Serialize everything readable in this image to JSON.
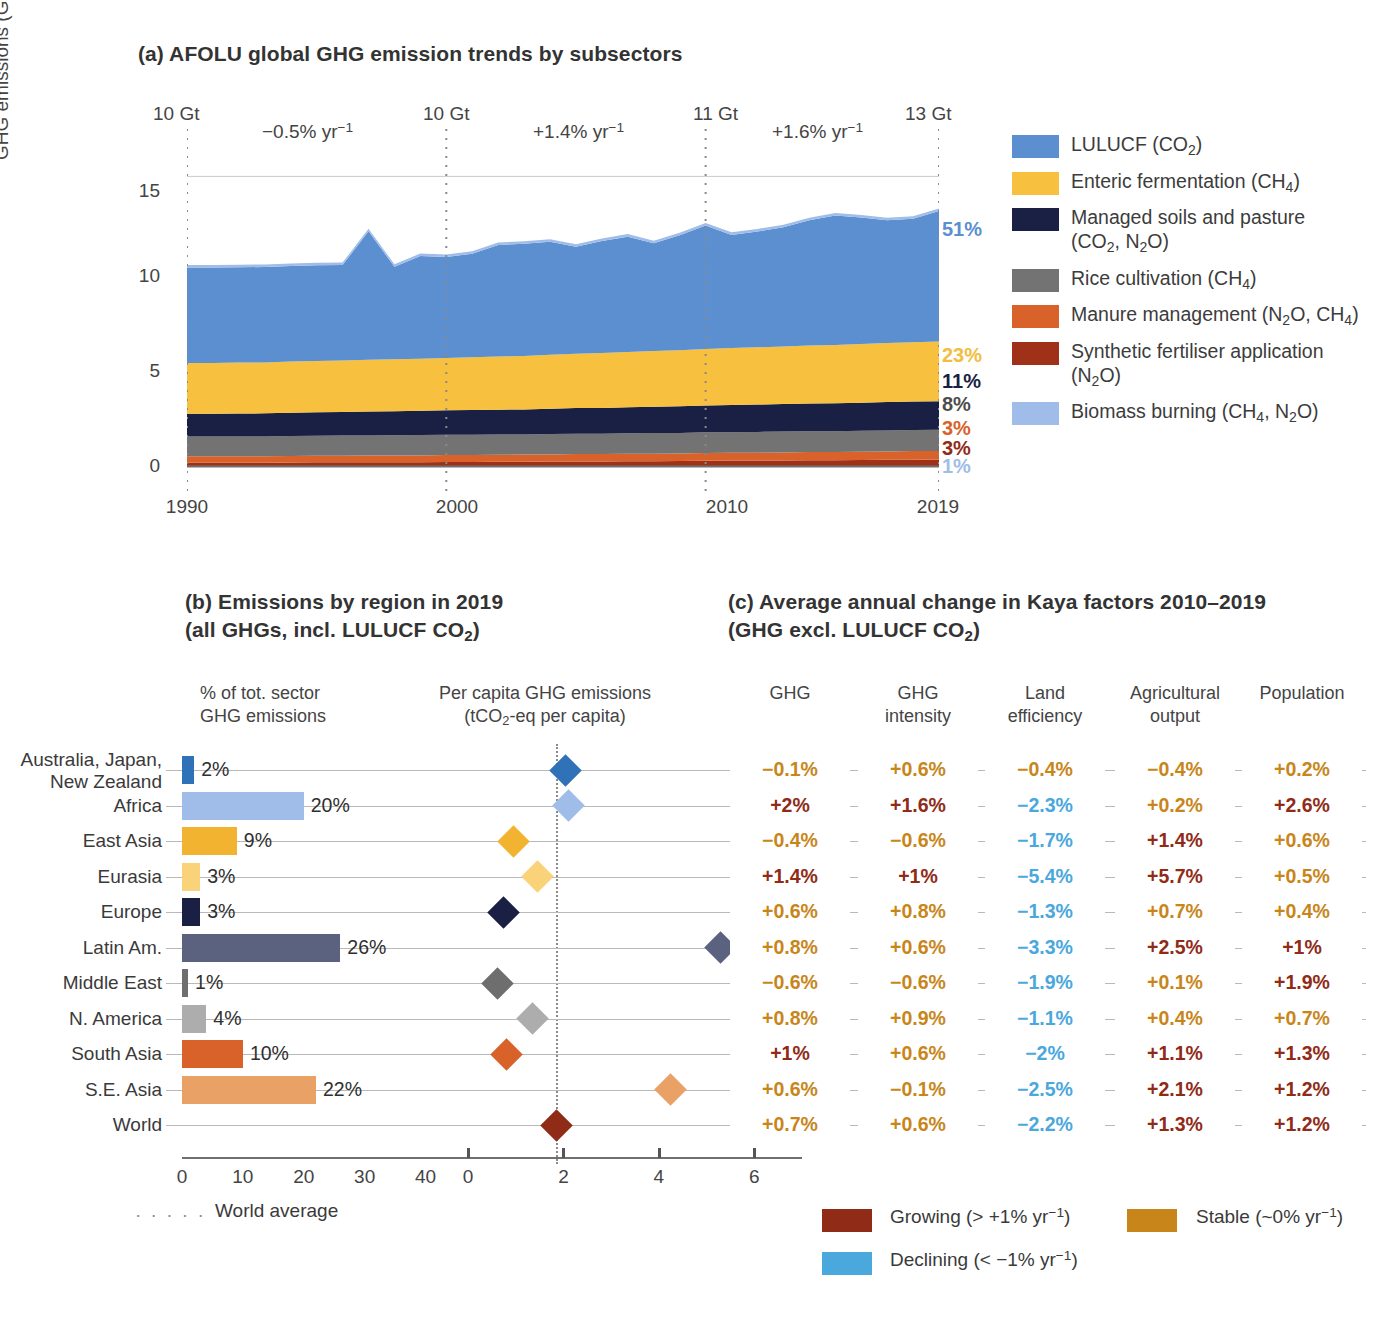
{
  "panel_a": {
    "title": "(a) AFOLU global GHG emission trends by subsectors",
    "y_axis_label": "GHG emissions (GtCO2-eq yr-1)",
    "y_ticks": [
      "15",
      "10",
      "5",
      "0"
    ],
    "x_ticks": [
      "1990",
      "2000",
      "2010",
      "2019"
    ],
    "gt_markers": [
      {
        "label": "10 Gt",
        "year": 1990
      },
      {
        "label": "10 Gt",
        "year": 2000
      },
      {
        "label": "11 Gt",
        "year": 2010
      },
      {
        "label": "13 Gt",
        "year": 2019
      }
    ],
    "rate_labels": [
      {
        "label": "−0.5% yr-1",
        "between": "1990-2000"
      },
      {
        "label": "+1.4% yr-1",
        "between": "2000-2010"
      },
      {
        "label": "+1.6% yr-1",
        "between": "2010-2019"
      }
    ],
    "share_labels": [
      {
        "value": "51%",
        "series": "LULUCF (CO2)",
        "color": "#5b8fd0"
      },
      {
        "value": "23%",
        "series": "Enteric fermentation (CH4)",
        "color": "#f2bd42"
      },
      {
        "value": "11%",
        "series": "Managed soils and pasture (CO2, N2O)",
        "color": "#1a1f44"
      },
      {
        "value": "8%",
        "series": "Rice cultivation (CH4)",
        "color": "#4d4d4d"
      },
      {
        "value": "3%",
        "series": "Manure management (N2O, CH4)",
        "color": "#d9622b"
      },
      {
        "value": "3%",
        "series": "Synthetic fertiliser application (N2O)",
        "color": "#8f2b17"
      },
      {
        "value": "1%",
        "series": "Biomass burning (CH4, N2O)",
        "color": "#9fbde8"
      }
    ],
    "legend": [
      {
        "label_html": "LULUCF (CO<sub>2</sub>)",
        "color": "#5b8fd0"
      },
      {
        "label_html": "Enteric fermentation (CH<sub>4</sub>)",
        "color": "#f7c03f"
      },
      {
        "label_html": "Managed soils and pasture<br>(CO<sub>2</sub>, N<sub>2</sub>O)",
        "color": "#1a1f44"
      },
      {
        "label_html": "Rice cultivation (CH<sub>4</sub>)",
        "color": "#737373"
      },
      {
        "label_html": "Manure management (N<sub>2</sub>O, CH<sub>4</sub>)",
        "color": "#d9622b"
      },
      {
        "label_html": "Synthetic fertiliser application<br>(N<sub>2</sub>O)",
        "color": "#9e3118"
      },
      {
        "label_html": "Biomass burning (CH<sub>4</sub>, N<sub>2</sub>O)",
        "color": "#9fbde8"
      }
    ]
  },
  "panel_b": {
    "title_line1": "(b) Emissions by region in 2019",
    "title_line2": "(all GHGs, incl. LULUCF CO2)",
    "col1_head_line1": "% of tot. sector",
    "col1_head_line2": "GHG emissions",
    "col2_head_line1": "Per capita GHG emissions",
    "col2_head_line2": "(tCO2-eq per capita)",
    "x_ticks_left": [
      "0",
      "10",
      "20",
      "30",
      "40"
    ],
    "x_ticks_right": [
      "0",
      "2",
      "4",
      "6"
    ],
    "world_average_label": "World average"
  },
  "panel_c": {
    "title_line1": "(c) Average annual change in Kaya factors 2010–2019",
    "title_line2": "(GHG excl. LULUCF CO2)",
    "columns": [
      "GHG",
      "GHG intensity",
      "Land efficiency",
      "Agricultural output",
      "Population"
    ],
    "columns_split": [
      {
        "l1": "GHG",
        "l2": ""
      },
      {
        "l1": "GHG",
        "l2": "intensity"
      },
      {
        "l1": "Land",
        "l2": "efficiency"
      },
      {
        "l1": "Agricultural",
        "l2": "output"
      },
      {
        "l1": "Population",
        "l2": ""
      }
    ],
    "category_legend": [
      {
        "label": "Growing (> +1% yr-1)",
        "color": "#8f2b17"
      },
      {
        "label": "Stable (~0% yr-1)",
        "color": "#c8861a"
      },
      {
        "label": "Declining (< −1% yr-1)",
        "color": "#4aa8dd"
      }
    ]
  },
  "colors": {
    "growing": "#8f2b17",
    "stable": "#c8861a",
    "declining": "#4aa8dd",
    "gridline": "#b9b9b9",
    "axis": "#707070"
  },
  "chart_data": {
    "type": "area",
    "title": "(a) AFOLU global GHG emission trends by subsectors",
    "xlabel": "",
    "ylabel": "GHG emissions (GtCO2-eq yr-1)",
    "xlim": [
      1990,
      2019
    ],
    "ylim": [
      0,
      16
    ],
    "yticks": [
      0,
      5,
      10,
      15
    ],
    "grid": true,
    "legend_position": "right",
    "x": [
      1990,
      1991,
      1992,
      1993,
      1994,
      1995,
      1996,
      1997,
      1998,
      1999,
      2000,
      2001,
      2002,
      2003,
      2004,
      2005,
      2006,
      2007,
      2008,
      2009,
      2010,
      2011,
      2012,
      2013,
      2014,
      2015,
      2016,
      2017,
      2018,
      2019
    ],
    "series": [
      {
        "name": "Synthetic fertiliser application (N2O)",
        "color": "#9e3118",
        "values": [
          0.22,
          0.22,
          0.22,
          0.22,
          0.23,
          0.24,
          0.24,
          0.24,
          0.25,
          0.25,
          0.26,
          0.26,
          0.27,
          0.27,
          0.28,
          0.29,
          0.29,
          0.3,
          0.3,
          0.31,
          0.32,
          0.33,
          0.33,
          0.34,
          0.35,
          0.35,
          0.36,
          0.37,
          0.38,
          0.39
        ]
      },
      {
        "name": "Manure management (N2O, CH4)",
        "color": "#d9622b",
        "values": [
          0.33,
          0.33,
          0.33,
          0.33,
          0.34,
          0.34,
          0.34,
          0.35,
          0.35,
          0.35,
          0.36,
          0.36,
          0.36,
          0.37,
          0.37,
          0.38,
          0.38,
          0.38,
          0.39,
          0.39,
          0.4,
          0.4,
          0.41,
          0.41,
          0.42,
          0.42,
          0.43,
          0.43,
          0.44,
          0.44
        ]
      },
      {
        "name": "Rice cultivation (CH4)",
        "color": "#737373",
        "values": [
          1.02,
          1.02,
          1.02,
          1.03,
          1.03,
          1.03,
          1.04,
          1.04,
          1.04,
          1.05,
          1.05,
          1.05,
          1.05,
          1.04,
          1.05,
          1.05,
          1.05,
          1.06,
          1.06,
          1.06,
          1.07,
          1.07,
          1.07,
          1.08,
          1.08,
          1.08,
          1.08,
          1.09,
          1.09,
          1.09
        ]
      },
      {
        "name": "Managed soils and pasture (CO2, N2O)",
        "color": "#1a1f44",
        "values": [
          1.18,
          1.18,
          1.19,
          1.19,
          1.2,
          1.21,
          1.22,
          1.23,
          1.24,
          1.25,
          1.26,
          1.27,
          1.28,
          1.29,
          1.31,
          1.32,
          1.33,
          1.34,
          1.36,
          1.37,
          1.38,
          1.4,
          1.41,
          1.42,
          1.43,
          1.44,
          1.45,
          1.46,
          1.47,
          1.48
        ]
      },
      {
        "name": "Enteric fermentation (CH4)",
        "color": "#f7c03f",
        "values": [
          2.62,
          2.62,
          2.63,
          2.63,
          2.64,
          2.65,
          2.66,
          2.67,
          2.68,
          2.69,
          2.7,
          2.72,
          2.74,
          2.76,
          2.78,
          2.81,
          2.83,
          2.85,
          2.88,
          2.9,
          2.92,
          2.94,
          2.96,
          2.97,
          2.99,
          3.01,
          3.03,
          3.05,
          3.06,
          3.08
        ]
      },
      {
        "name": "LULUCF (CO2)",
        "color": "#5b8fd0",
        "values": [
          4.93,
          4.93,
          4.92,
          4.92,
          4.93,
          4.94,
          4.92,
          6.64,
          4.77,
          5.3,
          5.21,
          5.35,
          5.76,
          5.79,
          5.83,
          5.52,
          5.78,
          5.96,
          5.56,
          5.93,
          6.37,
          5.84,
          5.98,
          6.15,
          6.47,
          6.68,
          6.53,
          6.34,
          6.37,
          6.73
        ]
      },
      {
        "name": "Biomass burning (CH4, N2O)",
        "color": "#9fbde8",
        "values": [
          0.13,
          0.13,
          0.13,
          0.13,
          0.13,
          0.13,
          0.13,
          0.13,
          0.13,
          0.13,
          0.13,
          0.13,
          0.13,
          0.13,
          0.13,
          0.13,
          0.13,
          0.13,
          0.13,
          0.13,
          0.13,
          0.13,
          0.13,
          0.13,
          0.13,
          0.13,
          0.13,
          0.13,
          0.13,
          0.13
        ]
      }
    ],
    "totals_annotated": [
      {
        "year": 1990,
        "label": "10 Gt"
      },
      {
        "year": 2000,
        "label": "10 Gt"
      },
      {
        "year": 2010,
        "label": "11 Gt"
      },
      {
        "year": 2019,
        "label": "13 Gt"
      }
    ],
    "growth_rates": [
      "−0.5% yr-1",
      "+1.4% yr-1",
      "+1.6% yr-1"
    ]
  },
  "region_table": {
    "x_scale_left_max": 45,
    "x_scale_right_max": 7,
    "world_average_value": 1.85,
    "rows": [
      {
        "region": "Australia, Japan,\nNew Zealand",
        "share_pct": "2%",
        "share_value": 2,
        "per_capita": 2.05,
        "color": "#2f72b8",
        "kaya": [
          {
            "v": "−0.1%",
            "cat": "stable"
          },
          {
            "v": "+0.6%",
            "cat": "stable"
          },
          {
            "v": "−0.4%",
            "cat": "stable"
          },
          {
            "v": "−0.4%",
            "cat": "stable"
          },
          {
            "v": "+0.2%",
            "cat": "stable"
          }
        ]
      },
      {
        "region": "Africa",
        "share_pct": "20%",
        "share_value": 20,
        "per_capita": 2.1,
        "color": "#9fbde8",
        "kaya": [
          {
            "v": "+2%",
            "cat": "growing"
          },
          {
            "v": "+1.6%",
            "cat": "growing"
          },
          {
            "v": "−2.3%",
            "cat": "declining"
          },
          {
            "v": "+0.2%",
            "cat": "stable"
          },
          {
            "v": "+2.6%",
            "cat": "growing"
          }
        ]
      },
      {
        "region": "East Asia",
        "share_pct": "9%",
        "share_value": 9,
        "per_capita": 0.95,
        "color": "#f2b430",
        "kaya": [
          {
            "v": "−0.4%",
            "cat": "stable"
          },
          {
            "v": "−0.6%",
            "cat": "stable"
          },
          {
            "v": "−1.7%",
            "cat": "declining"
          },
          {
            "v": "+1.4%",
            "cat": "growing"
          },
          {
            "v": "+0.6%",
            "cat": "stable"
          }
        ]
      },
      {
        "region": "Eurasia",
        "share_pct": "3%",
        "share_value": 3,
        "per_capita": 1.45,
        "color": "#fad27a",
        "kaya": [
          {
            "v": "+1.4%",
            "cat": "growing"
          },
          {
            "v": "+1%",
            "cat": "growing"
          },
          {
            "v": "−5.4%",
            "cat": "declining"
          },
          {
            "v": "+5.7%",
            "cat": "growing"
          },
          {
            "v": "+0.5%",
            "cat": "stable"
          }
        ]
      },
      {
        "region": "Europe",
        "share_pct": "3%",
        "share_value": 3,
        "per_capita": 0.75,
        "color": "#1a1f44",
        "kaya": [
          {
            "v": "+0.6%",
            "cat": "stable"
          },
          {
            "v": "+0.8%",
            "cat": "stable"
          },
          {
            "v": "−1.3%",
            "cat": "declining"
          },
          {
            "v": "+0.7%",
            "cat": "stable"
          },
          {
            "v": "+0.4%",
            "cat": "stable"
          }
        ]
      },
      {
        "region": "Latin Am.",
        "share_pct": "26%",
        "share_value": 26,
        "per_capita": 5.3,
        "color": "#5a6280",
        "kaya": [
          {
            "v": "+0.8%",
            "cat": "stable"
          },
          {
            "v": "+0.6%",
            "cat": "stable"
          },
          {
            "v": "−3.3%",
            "cat": "declining"
          },
          {
            "v": "+2.5%",
            "cat": "growing"
          },
          {
            "v": "+1%",
            "cat": "growing"
          }
        ]
      },
      {
        "region": "Middle East",
        "share_pct": "1%",
        "share_value": 1,
        "per_capita": 0.62,
        "color": "#6e6e6e",
        "kaya": [
          {
            "v": "−0.6%",
            "cat": "stable"
          },
          {
            "v": "−0.6%",
            "cat": "stable"
          },
          {
            "v": "−1.9%",
            "cat": "declining"
          },
          {
            "v": "+0.1%",
            "cat": "stable"
          },
          {
            "v": "+1.9%",
            "cat": "growing"
          }
        ]
      },
      {
        "region": "N. America",
        "share_pct": "4%",
        "share_value": 4,
        "per_capita": 1.35,
        "color": "#adadad",
        "kaya": [
          {
            "v": "+0.8%",
            "cat": "stable"
          },
          {
            "v": "+0.9%",
            "cat": "stable"
          },
          {
            "v": "−1.1%",
            "cat": "declining"
          },
          {
            "v": "+0.4%",
            "cat": "stable"
          },
          {
            "v": "+0.7%",
            "cat": "stable"
          }
        ]
      },
      {
        "region": "South Asia",
        "share_pct": "10%",
        "share_value": 10,
        "per_capita": 0.8,
        "color": "#d9622b",
        "kaya": [
          {
            "v": "+1%",
            "cat": "growing"
          },
          {
            "v": "+0.6%",
            "cat": "stable"
          },
          {
            "v": "−2%",
            "cat": "declining"
          },
          {
            "v": "+1.1%",
            "cat": "growing"
          },
          {
            "v": "+1.3%",
            "cat": "growing"
          }
        ]
      },
      {
        "region": "S.E. Asia",
        "share_pct": "22%",
        "share_value": 22,
        "per_capita": 4.25,
        "color": "#e9a165",
        "kaya": [
          {
            "v": "+0.6%",
            "cat": "stable"
          },
          {
            "v": "−0.1%",
            "cat": "stable"
          },
          {
            "v": "−2.5%",
            "cat": "declining"
          },
          {
            "v": "+2.1%",
            "cat": "growing"
          },
          {
            "v": "+1.2%",
            "cat": "growing"
          }
        ]
      },
      {
        "region": "World",
        "share_pct": "",
        "share_value": 0,
        "per_capita": 1.85,
        "color": "#8f2b17",
        "kaya": [
          {
            "v": "+0.7%",
            "cat": "stable"
          },
          {
            "v": "+0.6%",
            "cat": "stable"
          },
          {
            "v": "−2.2%",
            "cat": "declining"
          },
          {
            "v": "+1.3%",
            "cat": "growing"
          },
          {
            "v": "+1.2%",
            "cat": "growing"
          }
        ]
      }
    ]
  }
}
